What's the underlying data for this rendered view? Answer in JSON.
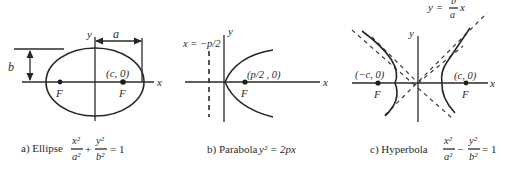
{
  "figure": {
    "panels": [
      {
        "id": "ellipse",
        "caption_prefix": "a) Ellipse",
        "equation": {
          "term1_num": "x²",
          "term1_den": "a²",
          "operator": "+",
          "term2_num": "y²",
          "term2_den": "b²",
          "rhs": "= 1"
        },
        "axis_labels": {
          "x": "x",
          "y": "y"
        },
        "dimension_labels": {
          "a": "a",
          "b": "b"
        },
        "foci": [
          {
            "label": "F",
            "coord": ""
          },
          {
            "label": "F",
            "coord": "(c, 0)"
          }
        ]
      },
      {
        "id": "parabola",
        "caption_prefix": "b) Parabola",
        "equation": {
          "text": "y² = 2px"
        },
        "axis_labels": {
          "x": "x",
          "y": "y"
        },
        "directrix_label": "x = −p/2",
        "focus": {
          "label": "F",
          "coord": "(p/2 , 0)"
        }
      },
      {
        "id": "hyperbola",
        "caption_prefix": "c) Hyperbola",
        "equation": {
          "term1_num": "x²",
          "term1_den": "a²",
          "operator": "−",
          "term2_num": "y²",
          "term2_den": "b²",
          "rhs": "= 1"
        },
        "axis_labels": {
          "x": "x",
          "y": "y"
        },
        "asymptote_label": {
          "lhs": "y =",
          "num": "b",
          "den": "a",
          "var": "x"
        },
        "foci": [
          {
            "label": "F",
            "coord": "(−c, 0)"
          },
          {
            "label": "F",
            "coord": "(c, 0)"
          }
        ]
      }
    ],
    "colors": {
      "ink": "#262626",
      "background": "#ffffff"
    }
  }
}
